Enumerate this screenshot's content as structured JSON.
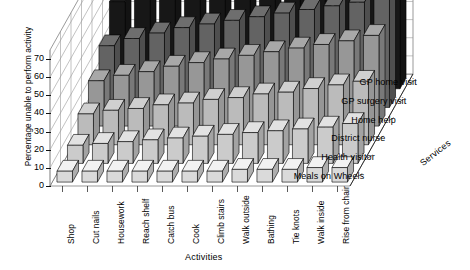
{
  "chart_data": {
    "type": "bar",
    "subtype": "3d-grouped-bar",
    "title": "",
    "xlabel": "Activities",
    "ylabel": "Percentage unable to perform activity",
    "zlabel": "Services",
    "ylim": [
      0,
      75
    ],
    "yticks": [
      0,
      10,
      20,
      30,
      40,
      50,
      60,
      70
    ],
    "grid": true,
    "legend_position": "right-depth-axis",
    "categories": [
      "Shop",
      "Cut nails",
      "Housework",
      "Reach shelf",
      "Catch bus",
      "Cook",
      "Climb stairs",
      "Walk outside",
      "Bathing",
      "Tie knots",
      "Walk inside",
      "Rise from chair"
    ],
    "series": [
      {
        "name": "Meals on Wheels",
        "color": "#f2f2f2",
        "values": [
          6,
          6,
          6,
          6,
          6,
          6,
          6,
          7,
          7,
          7,
          8,
          8
        ]
      },
      {
        "name": "Health visitor",
        "color": "#e2e2e2",
        "values": [
          10,
          11,
          12,
          13,
          14,
          15,
          16,
          17,
          18,
          19,
          20,
          22
        ]
      },
      {
        "name": "District nurse",
        "color": "#d0d0d0",
        "values": [
          17,
          19,
          20,
          22,
          23,
          25,
          26,
          28,
          29,
          31,
          33,
          35
        ]
      },
      {
        "name": "Home help",
        "color": "#a8a8a8",
        "values": [
          25,
          28,
          30,
          33,
          35,
          37,
          39,
          41,
          43,
          45,
          47,
          50
        ]
      },
      {
        "name": "GP surgery visit",
        "color": "#6e6e6e",
        "values": [
          34,
          38,
          41,
          44,
          46,
          48,
          50,
          52,
          54,
          56,
          58,
          60
        ]
      },
      {
        "name": "GP home visit",
        "color": "#1a1a1a",
        "values": [
          48,
          53,
          57,
          60,
          63,
          65,
          67,
          68,
          70,
          71,
          72,
          74
        ]
      }
    ]
  },
  "caption": {
    "partial_line": ""
  }
}
